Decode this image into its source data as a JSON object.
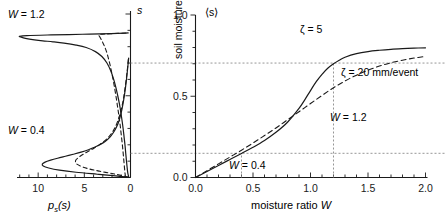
{
  "figure": {
    "panels": [
      "left-pdf-panel",
      "right-mean-panel"
    ]
  },
  "left_panel": {
    "x_axis_label": "p",
    "x_axis_label_sub": "s",
    "x_axis_label_tail": "(s)",
    "y_axis_label": "s",
    "x_ticks": [
      "10",
      "5",
      "0"
    ],
    "x_tick_values": [
      10,
      5,
      0
    ],
    "x_minor_step": 1,
    "xlim": [
      12.4,
      0
    ],
    "ylim": [
      0,
      1
    ],
    "annotations": [
      {
        "name": "w12-label",
        "text_prefix": "W",
        "text_body": " = 1.2"
      },
      {
        "name": "w04-label",
        "text_prefix": "W",
        "text_body": " = 0.4"
      }
    ]
  },
  "right_panel": {
    "x_axis_label_prefix": "moisture ratio ",
    "x_axis_label_var": "W",
    "y_axis_label": "soil moisture",
    "y_corner_label": "⟨s⟩",
    "x_ticks": [
      "0.0",
      "0.5",
      "1.0",
      "1.5",
      "2.0"
    ],
    "x_tick_values": [
      0.0,
      0.5,
      1.0,
      1.5,
      2.0
    ],
    "y_ticks": [
      "0.0",
      "0.5",
      "1.0"
    ],
    "y_tick_values": [
      0.0,
      0.5,
      1.0
    ],
    "xlim": [
      0,
      2
    ],
    "ylim": [
      0,
      1
    ],
    "annotations": [
      {
        "name": "zeta5-label",
        "text": "ζ = 5"
      },
      {
        "name": "zeta20-label",
        "text": "ζ = 20 mm/event"
      },
      {
        "name": "w12-guide-label",
        "text_prefix": "W",
        "text_body": " = 1.2"
      },
      {
        "name": "w04-guide-label",
        "text_prefix": "W",
        "text_body": " = 0.4"
      }
    ]
  },
  "chart_data": {
    "type": "line",
    "title": "",
    "panels": [
      {
        "id": "left-pdf-panel",
        "type": "line",
        "xlabel": "p_s(s)",
        "ylabel": "s",
        "xlim": [
          12.4,
          0
        ],
        "ylim": [
          0,
          1
        ],
        "xticks": [
          10,
          5,
          0
        ],
        "yticks": [],
        "grid": false,
        "note": "probability density functions of soil moisture, axis reversed (0 at right)",
        "series": [
          {
            "name": "W = 1.2, zeta = 5 (solid)",
            "style": "solid",
            "s": [
              0.005,
              0.03,
              0.07,
              0.11,
              0.15,
              0.2,
              0.25,
              0.3,
              0.35,
              0.4,
              0.45,
              0.5,
              0.55,
              0.6,
              0.65,
              0.7,
              0.74,
              0.77,
              0.795,
              0.81,
              0.822,
              0.83,
              0.836,
              0.842,
              0.848,
              0.854,
              0.86,
              0.864,
              0.868,
              0.872,
              0.876,
              0.88,
              0.884
            ],
            "p": [
              0.2,
              0.3,
              0.38,
              0.45,
              0.52,
              0.6,
              0.7,
              0.8,
              0.92,
              1.05,
              1.2,
              1.38,
              1.58,
              1.82,
              2.12,
              2.55,
              3.1,
              3.8,
              4.8,
              5.9,
              7.2,
              8.4,
              9.5,
              10.4,
              11.1,
              11.6,
              11.9,
              12.0,
              11.2,
              8.6,
              5.2,
              2.1,
              0.25
            ]
          },
          {
            "name": "W = 1.2, zeta = 20 (dashed)",
            "style": "dashed",
            "s": [
              0.005,
              0.04,
              0.09,
              0.14,
              0.2,
              0.26,
              0.32,
              0.38,
              0.44,
              0.5,
              0.56,
              0.62,
              0.68,
              0.73,
              0.77,
              0.8,
              0.825,
              0.845,
              0.86,
              0.87,
              0.876,
              0.88,
              0.884
            ],
            "p": [
              0.55,
              0.62,
              0.7,
              0.78,
              0.88,
              1.0,
              1.12,
              1.26,
              1.42,
              1.58,
              1.76,
              1.96,
              2.18,
              2.4,
              2.6,
              2.8,
              3.0,
              3.18,
              3.32,
              3.42,
              3.2,
              1.9,
              0.3
            ]
          },
          {
            "name": "W = 0.4, zeta = 5 (solid)",
            "style": "solid",
            "s": [
              0.002,
              0.01,
              0.02,
              0.032,
              0.045,
              0.058,
              0.07,
              0.082,
              0.094,
              0.106,
              0.118,
              0.13,
              0.142,
              0.155,
              0.17,
              0.185,
              0.2,
              0.22,
              0.245,
              0.275,
              0.31,
              0.355,
              0.41,
              0.48,
              0.56,
              0.65,
              0.73
            ],
            "p": [
              0.3,
              1.6,
              3.6,
              5.9,
              7.7,
              8.85,
              9.45,
              9.55,
              9.25,
              8.65,
              7.9,
              7.05,
              6.2,
              5.35,
              4.55,
              3.9,
              3.35,
              2.75,
              2.25,
              1.85,
              1.5,
              1.2,
              0.95,
              0.72,
              0.52,
              0.34,
              0.2
            ]
          },
          {
            "name": "W = 0.4, zeta = 20 (dashed)",
            "style": "dashed",
            "s": [
              0.002,
              0.012,
              0.024,
              0.038,
              0.052,
              0.066,
              0.08,
              0.094,
              0.108,
              0.122,
              0.136,
              0.15,
              0.164,
              0.178,
              0.195,
              0.215,
              0.24,
              0.27,
              0.305,
              0.35,
              0.405,
              0.47,
              0.55,
              0.64,
              0.73
            ],
            "p": [
              0.25,
              0.95,
              2.0,
              3.3,
              4.45,
              5.25,
              5.75,
              5.95,
              5.9,
              5.65,
              5.3,
              4.9,
              4.45,
              4.0,
              3.5,
              3.0,
              2.5,
              2.05,
              1.68,
              1.35,
              1.05,
              0.8,
              0.58,
              0.38,
              0.22
            ]
          }
        ]
      },
      {
        "id": "right-mean-panel",
        "type": "line",
        "xlabel": "moisture ratio W",
        "ylabel": "soil moisture",
        "corner_label": "⟨s⟩",
        "xlim": [
          0,
          2
        ],
        "ylim": [
          0,
          1
        ],
        "xticks": [
          0.0,
          0.5,
          1.0,
          1.5,
          2.0
        ],
        "yticks": [
          0.0,
          0.5,
          1.0
        ],
        "grid": false,
        "guides": [
          {
            "name": "w04-vertical",
            "type": "vline",
            "x": 0.4,
            "style": "dotted"
          },
          {
            "name": "w04-horizontal",
            "type": "hline",
            "y": 0.148,
            "style": "dotted"
          },
          {
            "name": "w12-vertical",
            "type": "vline",
            "x": 1.2,
            "style": "dotted"
          },
          {
            "name": "w12-horizontal",
            "type": "hline",
            "y": 0.7,
            "style": "dotted"
          }
        ],
        "series": [
          {
            "name": "ζ = 5",
            "style": "solid",
            "x": [
              0.0,
              0.1,
              0.2,
              0.3,
              0.4,
              0.5,
              0.6,
              0.7,
              0.8,
              0.9,
              0.95,
              1.0,
              1.05,
              1.1,
              1.15,
              1.2,
              1.25,
              1.3,
              1.4,
              1.5,
              1.6,
              1.7,
              1.8,
              1.9,
              2.0
            ],
            "y": [
              0.0,
              0.037,
              0.074,
              0.111,
              0.148,
              0.186,
              0.228,
              0.278,
              0.34,
              0.425,
              0.478,
              0.535,
              0.59,
              0.635,
              0.672,
              0.7,
              0.722,
              0.74,
              0.762,
              0.775,
              0.783,
              0.789,
              0.793,
              0.796,
              0.798
            ]
          },
          {
            "name": "ζ = 20 mm/event",
            "style": "dashed",
            "x": [
              0.0,
              0.1,
              0.2,
              0.3,
              0.4,
              0.5,
              0.6,
              0.7,
              0.8,
              0.9,
              1.0,
              1.1,
              1.2,
              1.3,
              1.4,
              1.5,
              1.6,
              1.7,
              1.8,
              1.9,
              2.0
            ],
            "y": [
              0.0,
              0.042,
              0.084,
              0.126,
              0.168,
              0.212,
              0.258,
              0.305,
              0.355,
              0.405,
              0.455,
              0.505,
              0.552,
              0.594,
              0.63,
              0.66,
              0.686,
              0.706,
              0.722,
              0.735,
              0.745
            ]
          }
        ]
      }
    ]
  }
}
